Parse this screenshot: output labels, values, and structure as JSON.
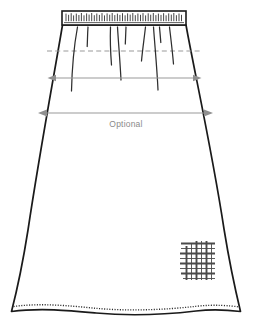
{
  "illustration": {
    "title": "A-line gathered skirt technical flat",
    "type": "fashion-technical-flat",
    "canvas": {
      "width": 256,
      "height": 333,
      "background": "#ffffff"
    }
  },
  "colors": {
    "outline": "#1a1a1a",
    "detail_line": "#333333",
    "dimension_gray": "#9a9a9a",
    "label_gray": "#8a8a8a",
    "swatch_gray": "#555555",
    "background": "#ffffff"
  },
  "garment": {
    "waistband": {
      "name": "gathered-waistband",
      "left": 62,
      "right": 186,
      "top": 11,
      "bottom": 25,
      "gather_tick_count": 46
    },
    "body": {
      "name": "skirt-body",
      "silhouette": "a-line-flared",
      "hem_style": "wavy-stitched"
    },
    "hipline": {
      "name": "hipline-guide",
      "style": "dashed",
      "y": 51,
      "left": 47,
      "right": 201
    },
    "gather_lines_count": 9,
    "hem_stitch": {
      "name": "hem-topstitching",
      "style": "fine-dashed"
    }
  },
  "swatch": {
    "name": "plaid-fabric-swatch",
    "pattern": "plaid-grid",
    "left": 180,
    "top": 240,
    "width": 36,
    "height": 41
  },
  "dimensions": [
    {
      "id": "hip-measure",
      "name": "hip-width-dimension",
      "label": "",
      "x1": 48,
      "x2": 201,
      "y": 78,
      "arrow_both_ends": true
    },
    {
      "id": "optional-measure",
      "name": "optional-width-dimension",
      "label": "Optional",
      "x1": 38,
      "x2": 213,
      "y": 113,
      "arrow_both_ends": true,
      "label_x": 126,
      "label_y": 127
    }
  ]
}
